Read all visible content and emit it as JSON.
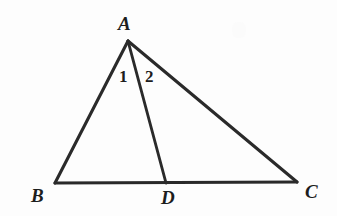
{
  "figure": {
    "background_color": "#fdfdfd",
    "line_color": "#2a2a2a",
    "label_color": "#1d1d1d",
    "canvas": {
      "width": 337,
      "height": 216
    }
  },
  "points": {
    "A": {
      "label": "A",
      "x": 128,
      "y": 41
    },
    "B": {
      "label": "B",
      "x": 55,
      "y": 183
    },
    "C": {
      "label": "C",
      "x": 297,
      "y": 182
    },
    "D": {
      "label": "D",
      "x": 166,
      "y": 183
    }
  },
  "segments": [
    {
      "name": "AB",
      "from": "A",
      "to": "B"
    },
    {
      "name": "AC",
      "from": "A",
      "to": "C"
    },
    {
      "name": "BC",
      "from": "B",
      "to": "C"
    },
    {
      "name": "AD",
      "from": "A",
      "to": "D"
    }
  ],
  "angle_labels": {
    "one": "1",
    "two": "2"
  }
}
